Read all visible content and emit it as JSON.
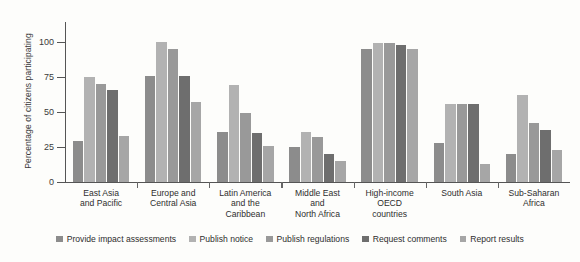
{
  "chart_data": {
    "type": "bar",
    "title": "",
    "xlabel": "",
    "ylabel": "Percentage of citizens participating",
    "ylim": [
      0,
      112
    ],
    "yticks": [
      0,
      25,
      50,
      75,
      100
    ],
    "ytick_labels": [
      "0",
      "25",
      "50",
      "75",
      "100"
    ],
    "grid": false,
    "legend_position": "bottom",
    "categories": [
      "East Asia and Pacific",
      "Europe and Central Asia",
      "Latin America and the Caribbean",
      "Middle East and North Africa",
      "High-income OECD countries",
      "South Asia",
      "Sub-Saharan Africa"
    ],
    "category_lines": [
      [
        "East Asia",
        "and Pacific"
      ],
      [
        "Europe and",
        "Central Asia"
      ],
      [
        "Latin America",
        "and the",
        "Caribbean"
      ],
      [
        "Middle East",
        "and",
        "North Africa"
      ],
      [
        "High-income",
        "OECD",
        "countries"
      ],
      [
        "South Asia"
      ],
      [
        "Sub-Saharan",
        "Africa"
      ]
    ],
    "series": [
      {
        "name": "Provide impact assessments",
        "color": "#8c8c8c",
        "values": [
          29,
          76,
          36,
          25,
          95,
          28,
          20
        ]
      },
      {
        "name": "Publish notice",
        "color": "#b2b2b2",
        "values": [
          75,
          100,
          69,
          36,
          99,
          56,
          62
        ]
      },
      {
        "name": "Publish regulations",
        "color": "#999999",
        "values": [
          70,
          95,
          49,
          32,
          99,
          56,
          42
        ]
      },
      {
        "name": "Request comments",
        "color": "#6e6e6e",
        "values": [
          66,
          76,
          35,
          20,
          98,
          56,
          37
        ]
      },
      {
        "name": "Report results",
        "color": "#a6a6a6",
        "values": [
          33,
          57,
          26,
          15,
          95,
          13,
          23
        ]
      }
    ]
  }
}
